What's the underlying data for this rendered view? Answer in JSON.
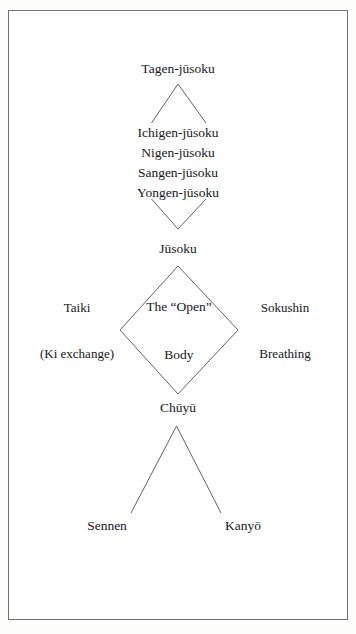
{
  "figure": {
    "type": "hierarchy-diagram",
    "background_color": "#ffffff",
    "border_color": "#6d7076",
    "text_color": "#15161a",
    "nodes": {
      "top": "Tagen-jūsoku",
      "branch_1": "Ichigen-jūsoku",
      "branch_2": "Nigen-jūsoku",
      "branch_3": "Sangen-jūsoku",
      "branch_4": "Yongen-jūsoku",
      "middle": "Jūsoku",
      "left_side_line_1": "Taiki",
      "left_side_line_2": "(Ki exchange)",
      "center_line_1": "The “Open”",
      "center_line_2": "Body",
      "right_side_line_1": "Sokushin",
      "right_side_line_2": "Breathing",
      "lower": "Chūyū",
      "leaf_left": "Sennen",
      "leaf_right": "Kanyō"
    }
  }
}
